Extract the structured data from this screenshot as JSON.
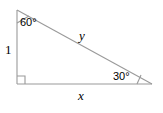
{
  "figure": {
    "kind": "right-triangle-diagram",
    "stroke_color": "#9a9a9a",
    "text_color": "#000000",
    "background_color": "#ffffff",
    "vertices": {
      "top_left": [
        17,
        10
      ],
      "bottom_left": [
        17,
        84
      ],
      "bottom_right": [
        152,
        84
      ]
    },
    "angles": {
      "top_left": "60°",
      "bottom_left": "90°",
      "bottom_right": "30°"
    },
    "sides": {
      "vertical_leg": "1",
      "hypotenuse": "y",
      "horizontal_leg": "x"
    },
    "markers": {
      "right_angle": "right-angle-square",
      "arc_top_left": "angle-arc",
      "arc_bottom_right": "angle-arc"
    }
  }
}
